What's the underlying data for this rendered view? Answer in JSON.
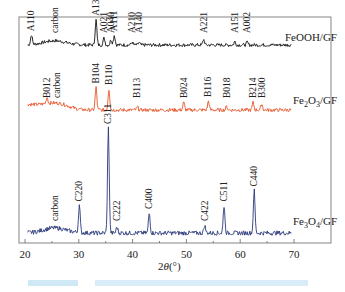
{
  "chart_data": {
    "type": "line",
    "title": "",
    "xlabel": "2θ(°)",
    "ylabel": "",
    "xlim": [
      20,
      70
    ],
    "xticks": [
      20,
      30,
      40,
      50,
      60,
      70
    ],
    "grid": false,
    "legend_position": "inline-right",
    "series": [
      {
        "name": "FeOOH/GF",
        "color": "#111111",
        "baseline_offset": 3,
        "peaks": [
          {
            "label": "A110",
            "x": 21.2,
            "h": 0.35
          },
          {
            "label": "carbon",
            "x": 25.5,
            "h": 0.15,
            "broad": true
          },
          {
            "label": "A130",
            "x": 33.2,
            "h": 0.9
          },
          {
            "label": "A021",
            "x": 34.7,
            "h": 0.25
          },
          {
            "label": "A040",
            "x": 36.0,
            "h": 0.2
          },
          {
            "label": "A111",
            "x": 36.6,
            "h": 0.35
          },
          {
            "label": "A210",
            "x": 39.9,
            "h": 0.1
          },
          {
            "label": "A140",
            "x": 41.2,
            "h": 0.08
          },
          {
            "label": "A221",
            "x": 53.2,
            "h": 0.2
          },
          {
            "label": "A151",
            "x": 59.0,
            "h": 0.12
          },
          {
            "label": "A002",
            "x": 61.3,
            "h": 0.1
          }
        ]
      },
      {
        "name": "Fe2O3/GF",
        "color": "#e8552a",
        "baseline_offset": 2,
        "peaks": [
          {
            "label": "B012",
            "x": 24.1,
            "h": 0.2
          },
          {
            "label": "carbon",
            "x": 26.0,
            "h": 0.15,
            "broad": true
          },
          {
            "label": "B104",
            "x": 33.2,
            "h": 0.75
          },
          {
            "label": "B110",
            "x": 35.6,
            "h": 0.7
          },
          {
            "label": "B113",
            "x": 40.9,
            "h": 0.1
          },
          {
            "label": "B024",
            "x": 49.5,
            "h": 0.25
          },
          {
            "label": "B116",
            "x": 54.1,
            "h": 0.3
          },
          {
            "label": "B018",
            "x": 57.5,
            "h": 0.12
          },
          {
            "label": "B214",
            "x": 62.4,
            "h": 0.25
          },
          {
            "label": "B300",
            "x": 64.0,
            "h": 0.2
          }
        ]
      },
      {
        "name": "Fe3O4/GF",
        "color": "#2b3a7a",
        "baseline_offset": 0,
        "peaks": [
          {
            "label": "carbon",
            "x": 25.5,
            "h": 0.1,
            "broad": true
          },
          {
            "label": "C220",
            "x": 30.1,
            "h": 0.55
          },
          {
            "label": "C311",
            "x": 35.5,
            "h": 2.1
          },
          {
            "label": "C222",
            "x": 37.1,
            "h": 0.12
          },
          {
            "label": "C400",
            "x": 43.1,
            "h": 0.4
          },
          {
            "label": "C422",
            "x": 53.4,
            "h": 0.15
          },
          {
            "label": "C511",
            "x": 57.0,
            "h": 0.55
          },
          {
            "label": "C440",
            "x": 62.6,
            "h": 0.85
          }
        ]
      }
    ]
  },
  "labels": {
    "xlabel_prefix": "2",
    "xlabel_theta": "θ",
    "xlabel_suffix": "(°)",
    "series_names": [
      {
        "base": "FeOOH/GF",
        "sub": "",
        "tail": ""
      },
      {
        "base": "Fe",
        "sub1": "2",
        "mid": "O",
        "sub2": "3",
        "tail": "/GF"
      },
      {
        "base": "Fe",
        "sub1": "3",
        "mid": "O",
        "sub2": "4",
        "tail": "/GF"
      }
    ]
  },
  "caption": {
    "text": "",
    "color": "#a9d6ee",
    "legible": false
  }
}
